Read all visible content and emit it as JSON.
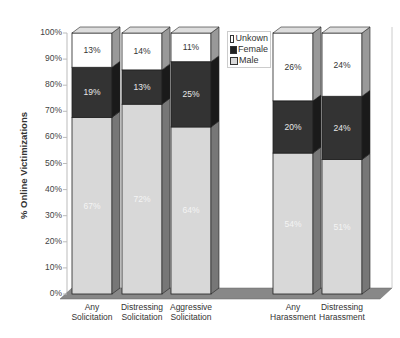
{
  "chart_data": {
    "type": "bar",
    "stacked": true,
    "three_d": true,
    "title": "",
    "xlabel": "",
    "ylabel": "% Online Victimizations",
    "ylim": [
      0,
      100
    ],
    "yticks": [
      "0%",
      "10%",
      "20%",
      "30%",
      "40%",
      "50%",
      "60%",
      "70%",
      "80%",
      "90%",
      "100%"
    ],
    "categories": [
      "Any Solicitation",
      "Distressing Solicitation",
      "Aggressive Solicitation",
      "Any Harassment",
      "Distressing Harassment"
    ],
    "category_lines": [
      [
        "Any",
        "Solicitation"
      ],
      [
        "Distressing",
        "Solicitation"
      ],
      [
        "Aggressive",
        "Solicitation"
      ],
      [
        "Any",
        "Harassment"
      ],
      [
        "Distressing",
        "Harassment"
      ]
    ],
    "series": [
      {
        "name": "Male",
        "color": "#d8d8d8",
        "values": [
          67,
          72,
          64,
          54,
          51
        ]
      },
      {
        "name": "Female",
        "color": "#333333",
        "values": [
          19,
          13,
          25,
          20,
          24
        ]
      },
      {
        "name": "Unkown",
        "color": "#ffffff",
        "values": [
          13,
          14,
          11,
          26,
          24
        ]
      }
    ],
    "legend": {
      "position": "top-center",
      "entries": [
        "Unkown",
        "Female",
        "Male"
      ]
    },
    "grid": false
  }
}
